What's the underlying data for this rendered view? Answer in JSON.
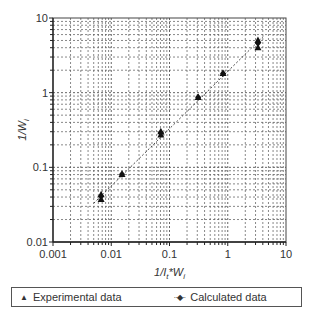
{
  "chart_data": {
    "type": "scatter",
    "title": "",
    "xlabel": "1/I_t*W_i",
    "ylabel": "1/W_i",
    "xscale": "log",
    "yscale": "log",
    "xlim": [
      0.001,
      10
    ],
    "ylim": [
      0.01,
      10
    ],
    "x_ticks": [
      "0.001",
      "0.01",
      "0.1",
      "1",
      "10"
    ],
    "y_ticks": [
      "0.01",
      "0.1",
      "1",
      "10"
    ],
    "grid": true,
    "legend_position": "bottom",
    "series": [
      {
        "name": "Experimental data",
        "marker": "triangle",
        "x": [
          0.0067,
          0.0067,
          0.0153,
          0.071,
          0.071,
          0.31,
          0.83,
          3.3,
          3.3
        ],
        "y": [
          0.037,
          0.043,
          0.08,
          0.27,
          0.3,
          0.86,
          1.8,
          4.0,
          5.0
        ]
      },
      {
        "name": "Calculated data",
        "marker": "diamond",
        "line": "dotted",
        "x": [
          0.0067,
          0.0153,
          0.071,
          0.31,
          0.83,
          3.3
        ],
        "y": [
          0.041,
          0.081,
          0.29,
          0.87,
          1.8,
          4.6
        ]
      }
    ]
  },
  "axes": {
    "x_title_prefix": "1/I",
    "x_title_sub": "t",
    "x_title_suffix": "*W",
    "x_title_sub2": "i",
    "y_title_prefix": "1/W",
    "y_title_sub": "i"
  },
  "legend": {
    "experimental_label": "Experimental data",
    "calculated_label": "Calculated data",
    "experimental_symbol": "▲",
    "calculated_symbol": "··◆··"
  }
}
